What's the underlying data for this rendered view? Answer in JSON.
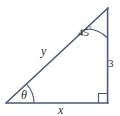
{
  "figure": {
    "type": "right-triangle-diagram",
    "background_color": "#ffffff",
    "stroke_color": "#49597c",
    "label_color": "#2b2b2b",
    "vertices": {
      "bottom_left": [
        6,
        103
      ],
      "bottom_right": [
        108,
        103
      ],
      "apex": [
        108,
        8
      ]
    },
    "labels": {
      "apex_angle": "45",
      "apex_angle_degree_symbol": "°",
      "base_angle": "θ",
      "hypotenuse": "y",
      "vertical_side": "3",
      "horizontal_side": "x"
    },
    "markers": {
      "right_angle": "right-angle-square",
      "apex_arc": "angle-arc",
      "base_arc": "angle-arc"
    }
  }
}
